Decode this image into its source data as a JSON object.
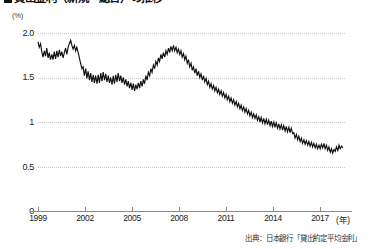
{
  "title": "貸出金利（新規・総合）の推移",
  "title_bullet": "■",
  "axis_unit": "(%)",
  "x_axis_unit": "(年)",
  "source": "出典：日本銀行「貸出約定平均金利」",
  "y_labels": [
    "2.0",
    "1.5",
    "1",
    "0.5",
    "0"
  ],
  "x_labels": [
    "1999",
    "2002",
    "2005",
    "2008",
    "2011",
    "2014",
    "2017"
  ],
  "colors": {
    "line": "#111111",
    "grid": "#cccccc",
    "axis": "#8a8a8a",
    "background": "#ffffff",
    "text": "#222222"
  },
  "chart_data": {
    "type": "line",
    "title": "貸出金利（新規・総合）の推移",
    "xlabel": "(年)",
    "ylabel": "(%)",
    "xlim": [
      1999,
      2019.4
    ],
    "ylim": [
      0,
      2.0
    ],
    "yticks": [
      0,
      0.5,
      1.0,
      1.5,
      2.0
    ],
    "xticks": [
      1999,
      2002,
      2005,
      2008,
      2011,
      2014,
      2017
    ],
    "grid": true,
    "legend": null,
    "series": [
      {
        "name": "貸出約定平均金利（新規・総合）",
        "color": "#111111",
        "x": [
          1999.0,
          1999.08,
          1999.17,
          1999.25,
          1999.33,
          1999.42,
          1999.5,
          1999.58,
          1999.67,
          1999.75,
          1999.83,
          1999.92,
          2000.0,
          2000.08,
          2000.17,
          2000.25,
          2000.33,
          2000.42,
          2000.5,
          2000.58,
          2000.67,
          2000.75,
          2000.83,
          2000.92,
          2001.0,
          2001.08,
          2001.17,
          2001.25,
          2001.33,
          2001.42,
          2001.5,
          2001.58,
          2001.67,
          2001.75,
          2001.83,
          2001.92,
          2002.0,
          2002.08,
          2002.17,
          2002.25,
          2002.33,
          2002.42,
          2002.5,
          2002.58,
          2002.67,
          2002.75,
          2002.83,
          2002.92,
          2003.0,
          2003.08,
          2003.17,
          2003.25,
          2003.33,
          2003.42,
          2003.5,
          2003.58,
          2003.67,
          2003.75,
          2003.83,
          2003.92,
          2004.0,
          2004.08,
          2004.17,
          2004.25,
          2004.33,
          2004.42,
          2004.5,
          2004.58,
          2004.67,
          2004.75,
          2004.83,
          2004.92,
          2005.0,
          2005.08,
          2005.17,
          2005.25,
          2005.33,
          2005.42,
          2005.5,
          2005.58,
          2005.67,
          2005.75,
          2005.83,
          2005.92,
          2006.0,
          2006.08,
          2006.17,
          2006.25,
          2006.33,
          2006.42,
          2006.5,
          2006.58,
          2006.67,
          2006.75,
          2006.83,
          2006.92,
          2007.0,
          2007.08,
          2007.17,
          2007.25,
          2007.33,
          2007.42,
          2007.5,
          2007.58,
          2007.67,
          2007.75,
          2007.83,
          2007.92,
          2008.0,
          2008.08,
          2008.17,
          2008.25,
          2008.33,
          2008.42,
          2008.5,
          2008.58,
          2008.67,
          2008.75,
          2008.83,
          2008.92,
          2009.0,
          2009.08,
          2009.17,
          2009.25,
          2009.33,
          2009.42,
          2009.5,
          2009.58,
          2009.67,
          2009.75,
          2009.83,
          2009.92,
          2010.0,
          2010.08,
          2010.17,
          2010.25,
          2010.33,
          2010.42,
          2010.5,
          2010.58,
          2010.67,
          2010.75,
          2010.83,
          2010.92,
          2011.0,
          2011.08,
          2011.17,
          2011.25,
          2011.33,
          2011.42,
          2011.5,
          2011.58,
          2011.67,
          2011.75,
          2011.83,
          2011.92,
          2012.0,
          2012.08,
          2012.17,
          2012.25,
          2012.33,
          2012.42,
          2012.5,
          2012.58,
          2012.67,
          2012.75,
          2012.83,
          2012.92,
          2013.0,
          2013.08,
          2013.17,
          2013.25,
          2013.33,
          2013.42,
          2013.5,
          2013.58,
          2013.67,
          2013.75,
          2013.83,
          2013.92,
          2014.0,
          2014.08,
          2014.17,
          2014.25,
          2014.33,
          2014.42,
          2014.5,
          2014.58,
          2014.67,
          2014.75,
          2014.83,
          2014.92,
          2015.0,
          2015.08,
          2015.17,
          2015.25,
          2015.33,
          2015.42,
          2015.5,
          2015.58,
          2015.67,
          2015.75,
          2015.83,
          2015.92,
          2016.0,
          2016.08,
          2016.17,
          2016.25,
          2016.33,
          2016.42,
          2016.5,
          2016.58,
          2016.67,
          2016.75,
          2016.83,
          2016.92,
          2017.0,
          2017.08,
          2017.17,
          2017.25,
          2017.33,
          2017.42,
          2017.5,
          2017.58,
          2017.67,
          2017.75,
          2017.83,
          2017.92,
          2018.0,
          2018.08,
          2018.17,
          2018.25,
          2018.33,
          2018.42,
          2018.5,
          2018.58,
          2018.67,
          2018.75,
          2018.83,
          2018.92,
          2019.0,
          2019.08,
          2019.17,
          2019.25
        ],
        "y": [
          1.9,
          1.84,
          1.88,
          1.79,
          1.73,
          1.8,
          1.74,
          1.83,
          1.72,
          1.78,
          1.7,
          1.76,
          1.7,
          1.79,
          1.71,
          1.8,
          1.73,
          1.81,
          1.74,
          1.79,
          1.72,
          1.78,
          1.83,
          1.76,
          1.84,
          1.88,
          1.92,
          1.86,
          1.82,
          1.86,
          1.8,
          1.84,
          1.78,
          1.72,
          1.66,
          1.6,
          1.62,
          1.52,
          1.6,
          1.49,
          1.57,
          1.47,
          1.55,
          1.45,
          1.53,
          1.44,
          1.52,
          1.43,
          1.53,
          1.44,
          1.55,
          1.46,
          1.56,
          1.47,
          1.54,
          1.45,
          1.52,
          1.44,
          1.5,
          1.42,
          1.52,
          1.43,
          1.53,
          1.45,
          1.55,
          1.46,
          1.52,
          1.44,
          1.5,
          1.42,
          1.48,
          1.4,
          1.46,
          1.38,
          1.44,
          1.36,
          1.43,
          1.35,
          1.42,
          1.37,
          1.44,
          1.38,
          1.46,
          1.4,
          1.48,
          1.43,
          1.52,
          1.47,
          1.56,
          1.52,
          1.6,
          1.56,
          1.64,
          1.6,
          1.68,
          1.64,
          1.72,
          1.68,
          1.76,
          1.71,
          1.78,
          1.73,
          1.8,
          1.76,
          1.83,
          1.78,
          1.85,
          1.8,
          1.86,
          1.8,
          1.84,
          1.78,
          1.82,
          1.76,
          1.8,
          1.73,
          1.77,
          1.7,
          1.74,
          1.66,
          1.7,
          1.62,
          1.66,
          1.58,
          1.62,
          1.55,
          1.6,
          1.52,
          1.57,
          1.5,
          1.54,
          1.47,
          1.52,
          1.45,
          1.49,
          1.42,
          1.46,
          1.39,
          1.43,
          1.37,
          1.41,
          1.35,
          1.39,
          1.33,
          1.37,
          1.31,
          1.35,
          1.29,
          1.33,
          1.27,
          1.31,
          1.25,
          1.29,
          1.23,
          1.27,
          1.21,
          1.25,
          1.19,
          1.23,
          1.17,
          1.21,
          1.15,
          1.19,
          1.13,
          1.17,
          1.11,
          1.15,
          1.09,
          1.13,
          1.07,
          1.11,
          1.05,
          1.09,
          1.04,
          1.08,
          1.02,
          1.06,
          1.0,
          1.05,
          0.99,
          1.04,
          0.98,
          1.03,
          0.97,
          1.02,
          0.96,
          1.01,
          0.95,
          1.0,
          0.94,
          0.99,
          0.93,
          0.98,
          0.92,
          0.97,
          0.91,
          0.96,
          0.9,
          0.95,
          0.89,
          0.94,
          0.88,
          0.93,
          0.87,
          0.88,
          0.82,
          0.86,
          0.8,
          0.84,
          0.78,
          0.82,
          0.76,
          0.8,
          0.75,
          0.79,
          0.74,
          0.78,
          0.73,
          0.77,
          0.72,
          0.76,
          0.71,
          0.75,
          0.7,
          0.74,
          0.7,
          0.75,
          0.71,
          0.76,
          0.7,
          0.74,
          0.68,
          0.72,
          0.66,
          0.7,
          0.65,
          0.69,
          0.67,
          0.72,
          0.68,
          0.74,
          0.7,
          0.73,
          0.71
        ]
      }
    ]
  }
}
